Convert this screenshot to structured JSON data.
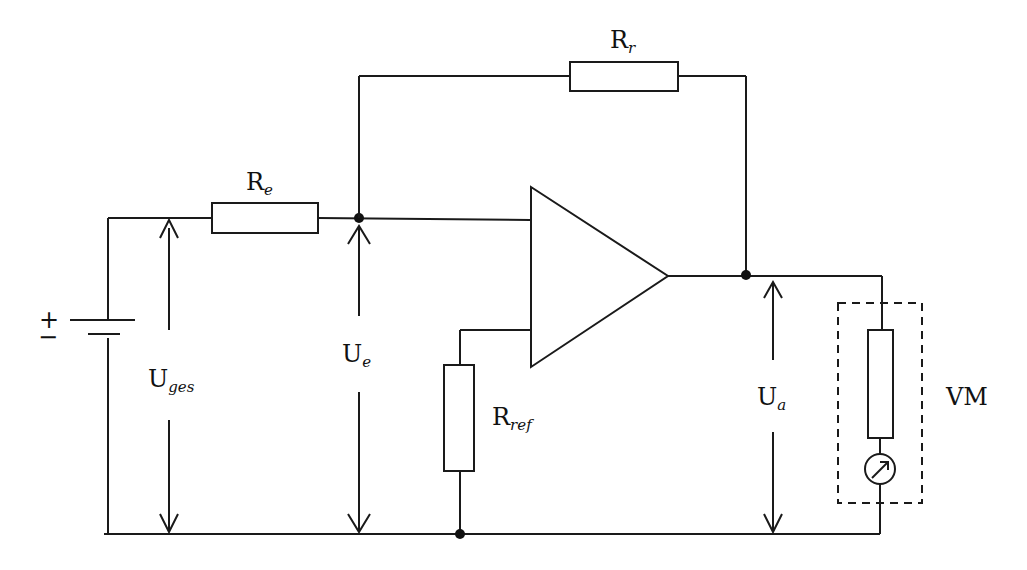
{
  "diagram": {
    "labels": {
      "R_r": {
        "main": "R",
        "sub": "r"
      },
      "R_e": {
        "main": "R",
        "sub": "e"
      },
      "R_ref": {
        "main": "R",
        "sub": "ref"
      },
      "U_ges": {
        "main": "U",
        "sub": "ges"
      },
      "U_e": {
        "main": "U",
        "sub": "e"
      },
      "U_a": {
        "main": "U",
        "sub": "a"
      },
      "VM": "VM",
      "battery_plus": "+",
      "battery_minus": "−"
    },
    "components": [
      {
        "id": "battery",
        "type": "dc-source"
      },
      {
        "id": "R_e",
        "type": "resistor",
        "orientation": "horizontal"
      },
      {
        "id": "R_r",
        "type": "resistor",
        "orientation": "horizontal"
      },
      {
        "id": "opamp",
        "type": "amplifier-triangle"
      },
      {
        "id": "R_ref",
        "type": "resistor",
        "orientation": "vertical"
      },
      {
        "id": "VM",
        "type": "voltmeter",
        "contains": [
          "internal-resistor",
          "meter"
        ]
      }
    ],
    "colors": {
      "line": "#1a1a1a",
      "background": "#ffffff"
    }
  }
}
